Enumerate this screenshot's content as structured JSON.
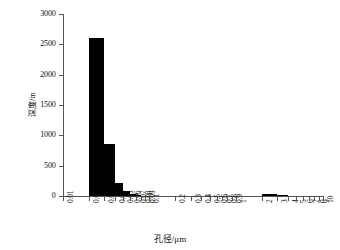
{
  "chart_data": {
    "type": "bar",
    "title": "",
    "xlabel": "孔径/μm",
    "ylabel": "深度/m",
    "ylim": [
      0,
      3000
    ],
    "yticks": [
      0,
      500,
      1000,
      1500,
      2000,
      2500,
      3000
    ],
    "ytick_labels": [
      "0",
      "500",
      "1000",
      "1500",
      "2000",
      "2500",
      "3000"
    ],
    "xscale": "log",
    "xlim": [
      0.01,
      10
    ],
    "xtick_labels": [
      "0.01",
      "0.02",
      "0.03",
      "0.04",
      "0.05",
      "0.06",
      "0.07",
      "0.08",
      "0.09",
      "0.1",
      "0.2",
      "0.3",
      "0.4",
      "0.5",
      "0.6",
      "0.7",
      "0.8",
      "0.9",
      "1",
      "2",
      "3",
      "4",
      "5",
      "6",
      "7",
      "8",
      "9",
      "10"
    ],
    "xticks": [
      0.01,
      0.02,
      0.03,
      0.04,
      0.05,
      0.06,
      0.07,
      0.08,
      0.09,
      0.1,
      0.2,
      0.3,
      0.4,
      0.5,
      0.6,
      0.7,
      0.8,
      0.9,
      1,
      2,
      3,
      4,
      5,
      6,
      7,
      8,
      9,
      10
    ],
    "grid": false,
    "legend": false,
    "bar_color": "#000000",
    "bins": [
      {
        "x0": 0.02,
        "x1": 0.03,
        "value": 2610
      },
      {
        "x0": 0.03,
        "x1": 0.04,
        "value": 860
      },
      {
        "x0": 0.04,
        "x1": 0.05,
        "value": 220
      },
      {
        "x0": 0.05,
        "x1": 0.06,
        "value": 90
      },
      {
        "x0": 0.06,
        "x1": 0.07,
        "value": 40
      },
      {
        "x0": 0.07,
        "x1": 0.08,
        "value": 20
      },
      {
        "x0": 2.0,
        "x1": 3.0,
        "value": 35
      },
      {
        "x0": 3.0,
        "x1": 4.0,
        "value": 15
      }
    ]
  }
}
